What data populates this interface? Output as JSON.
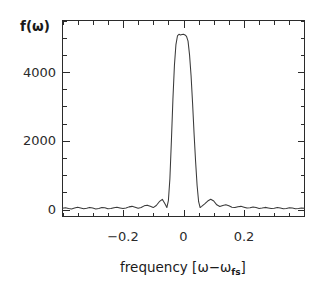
{
  "chart_data": {
    "type": "line",
    "title": "",
    "subtitle": "",
    "xlabel": "frequency [ω−ωfs]",
    "xlabel_parts": {
      "text": "frequency  [",
      "omega": "ω",
      "minus": "−",
      "omega2": "ω",
      "subscript": "fs",
      "close": "]"
    },
    "ylabel": "f(ω)",
    "xlim": [
      -0.4,
      0.4
    ],
    "ylim": [
      -200,
      5500
    ],
    "grid": false,
    "legend": null,
    "xticks": [
      -0.2,
      0,
      0.2
    ],
    "xtick_labels": [
      "−0.2",
      "0",
      "0.2"
    ],
    "yticks": [
      0,
      2000,
      4000
    ],
    "ytick_labels": [
      "0",
      "2000",
      "4000"
    ],
    "x_minor_tick_step": 0.05,
    "y_minor_tick_step": 500,
    "line_color": "#3a3a3a",
    "axis_color": "#2b2b2b",
    "background_color": "#ffffff",
    "peak_value": 5100,
    "peak_position": 0.0,
    "x": [
      -0.4,
      -0.39,
      -0.38,
      -0.37,
      -0.36,
      -0.35,
      -0.34,
      -0.33,
      -0.32,
      -0.31,
      -0.3,
      -0.29,
      -0.28,
      -0.27,
      -0.26,
      -0.25,
      -0.24,
      -0.23,
      -0.22,
      -0.21,
      -0.2,
      -0.19,
      -0.18,
      -0.17,
      -0.16,
      -0.15,
      -0.14,
      -0.13,
      -0.12,
      -0.11,
      -0.1,
      -0.09,
      -0.08,
      -0.07,
      -0.06,
      -0.055,
      -0.05,
      -0.045,
      -0.04,
      -0.035,
      -0.03,
      -0.025,
      -0.02,
      -0.015,
      -0.01,
      -0.005,
      0.0,
      0.005,
      0.01,
      0.015,
      0.02,
      0.025,
      0.03,
      0.035,
      0.04,
      0.045,
      0.05,
      0.055,
      0.06,
      0.07,
      0.08,
      0.09,
      0.1,
      0.11,
      0.12,
      0.13,
      0.14,
      0.15,
      0.16,
      0.17,
      0.18,
      0.19,
      0.2,
      0.21,
      0.22,
      0.23,
      0.24,
      0.25,
      0.26,
      0.27,
      0.28,
      0.29,
      0.3,
      0.31,
      0.32,
      0.33,
      0.34,
      0.35,
      0.36,
      0.37,
      0.38,
      0.39,
      0.4
    ],
    "y": [
      40,
      55,
      35,
      20,
      45,
      70,
      50,
      25,
      40,
      65,
      45,
      20,
      35,
      60,
      55,
      25,
      30,
      55,
      70,
      50,
      30,
      45,
      80,
      95,
      70,
      40,
      60,
      110,
      130,
      95,
      60,
      120,
      230,
      300,
      150,
      60,
      260,
      900,
      2000,
      3200,
      4200,
      4800,
      5050,
      5100,
      5080,
      5090,
      5100,
      5080,
      5040,
      4900,
      4500,
      3900,
      3100,
      2200,
      1400,
      700,
      230,
      60,
      95,
      170,
      250,
      300,
      250,
      140,
      90,
      120,
      140,
      110,
      70,
      60,
      85,
      95,
      70,
      45,
      55,
      75,
      60,
      35,
      45,
      65,
      50,
      30,
      40,
      60,
      45,
      25,
      35,
      55,
      45,
      25,
      35,
      50,
      40
    ]
  },
  "figure": {
    "ylabel_text": "f(ω)"
  }
}
